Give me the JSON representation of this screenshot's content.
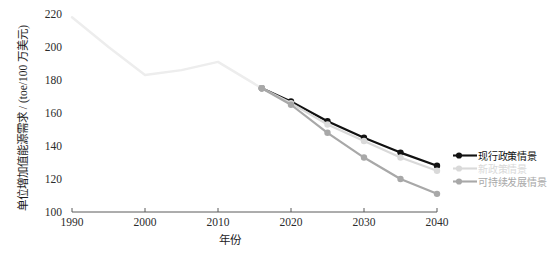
{
  "axes": {
    "y_title": "单位增加值能源需求 / (toe/100 万美元)",
    "x_title": "年份",
    "y_ticks": [
      "100",
      "120",
      "140",
      "160",
      "180",
      "200",
      "220"
    ],
    "x_ticks": [
      "1990",
      "2000",
      "2010",
      "2020",
      "2030",
      "2040"
    ]
  },
  "legend": {
    "items": [
      {
        "label": "现行政策情景",
        "color": "#111111"
      },
      {
        "label": "新政策情景",
        "color": "#d9d9d9"
      },
      {
        "label": "可持续发展情景",
        "color": "#a8a8a8"
      }
    ]
  },
  "caption": "",
  "colors": {
    "historical": "#ededed",
    "current_policies": "#111111",
    "new_policies": "#d9d9d9",
    "sustainable_development": "#a8a8a8",
    "axis": "#5a5a5a",
    "background": "#ffffff"
  },
  "chart_data": {
    "type": "line",
    "title": "",
    "xlabel": "年份",
    "ylabel": "单位增加值能源需求 / (toe/100 万美元)",
    "xlim": [
      1990,
      2040
    ],
    "ylim": [
      100,
      220
    ],
    "grid": false,
    "legend_position": "right",
    "series": [
      {
        "name": "历史",
        "color": "#ededed",
        "markers": false,
        "x": [
          1990,
          1995,
          2000,
          2005,
          2010,
          2016
        ],
        "values": [
          218,
          200,
          183,
          186,
          191,
          175
        ]
      },
      {
        "name": "现行政策情景",
        "color": "#111111",
        "markers": true,
        "x": [
          2016,
          2020,
          2025,
          2030,
          2035,
          2040
        ],
        "values": [
          175,
          167,
          155,
          145,
          136,
          128
        ]
      },
      {
        "name": "新政策情景",
        "color": "#d9d9d9",
        "markers": true,
        "x": [
          2016,
          2020,
          2025,
          2030,
          2035,
          2040
        ],
        "values": [
          175,
          166,
          153,
          143,
          133,
          125
        ]
      },
      {
        "name": "可持续发展情景",
        "color": "#a8a8a8",
        "markers": true,
        "x": [
          2016,
          2020,
          2025,
          2030,
          2035,
          2040
        ],
        "values": [
          175,
          165,
          148,
          133,
          120,
          111
        ]
      }
    ]
  }
}
